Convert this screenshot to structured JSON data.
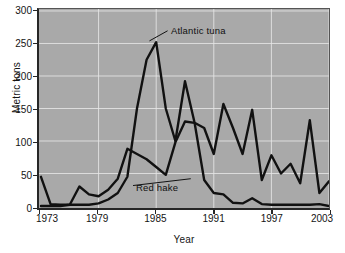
{
  "chart_data": {
    "type": "line",
    "title": "",
    "xlabel": "Year",
    "ylabel": "Metric tons",
    "xlim": [
      1973,
      2003
    ],
    "ylim": [
      0,
      300
    ],
    "xticks": [
      1973,
      1979,
      1985,
      1991,
      1997,
      2003
    ],
    "yticks": [
      0,
      50,
      100,
      150,
      200,
      250,
      300
    ],
    "grid": true,
    "legend_position": "inline-annotations",
    "line_color": "#111111",
    "plot_background": "#a9a9a9",
    "gridline_color": "#e8e8e8",
    "x": [
      1973,
      1974,
      1975,
      1976,
      1977,
      1978,
      1979,
      1980,
      1981,
      1982,
      1983,
      1984,
      1985,
      1986,
      1987,
      1988,
      1989,
      1990,
      1991,
      1992,
      1993,
      1994,
      1995,
      1996,
      1997,
      1998,
      1999,
      2000,
      2001,
      2002,
      2003
    ],
    "series": [
      {
        "name": "Atlantic tuna",
        "values": [
          45,
          3,
          2,
          2,
          2,
          2,
          4,
          10,
          20,
          45,
          150,
          225,
          252,
          150,
          100,
          192,
          128,
          120,
          80,
          157,
          120,
          80,
          148,
          40,
          78,
          50,
          65,
          35,
          132,
          20,
          38
        ]
      },
      {
        "name": "Red hake",
        "values": [
          0,
          0,
          0,
          2,
          30,
          18,
          15,
          25,
          42,
          88,
          80,
          72,
          60,
          48,
          98,
          130,
          128,
          40,
          20,
          18,
          5,
          4,
          12,
          3,
          2,
          2,
          2,
          2,
          2,
          3,
          0
        ]
      }
    ],
    "annotations": [
      {
        "label": "Atlantic tuna",
        "x": 1986.6,
        "y": 268,
        "points_to_x": 1984.3,
        "points_to_y": 254
      },
      {
        "label": "Red hake",
        "x": 1983.0,
        "y": 30,
        "points_to_x": 1988.6,
        "points_to_y": 42
      }
    ]
  }
}
